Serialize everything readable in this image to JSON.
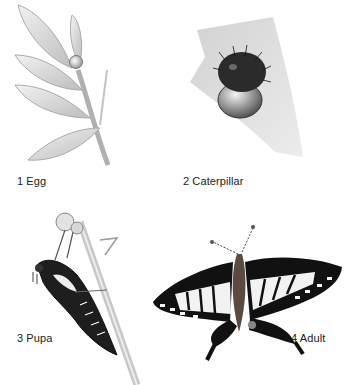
{
  "diagram": {
    "stages": [
      {
        "label": "1 Egg",
        "icon": "egg-on-leaf-icon"
      },
      {
        "label": "2 Caterpillar",
        "icon": "caterpillar-hatching-icon"
      },
      {
        "label": "3 Pupa",
        "icon": "pupa-on-stem-icon"
      },
      {
        "label": "4 Adult",
        "icon": "swallowtail-butterfly-icon"
      }
    ]
  }
}
